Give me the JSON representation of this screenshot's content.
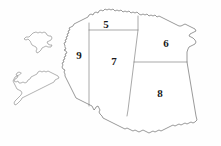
{
  "map": {
    "title": "Numbered region outline map",
    "background_color": "#fefefe",
    "outline_color": "#6f6f6f",
    "island_outline_color": "#8a8a8a",
    "label_color": "#1a1a1a",
    "regions": [
      {
        "id": "region-5",
        "label": "5",
        "label_x": 106,
        "label_y": 24,
        "position": "north-central"
      },
      {
        "id": "region-6",
        "label": "6",
        "label_x": 166,
        "label_y": 43,
        "position": "north-east"
      },
      {
        "id": "region-7",
        "label": "7",
        "label_x": 114,
        "label_y": 61,
        "position": "central"
      },
      {
        "id": "region-8",
        "label": "8",
        "label_x": 160,
        "label_y": 93,
        "position": "south-east"
      },
      {
        "id": "region-9",
        "label": "9",
        "label_x": 79,
        "label_y": 55,
        "position": "west"
      }
    ],
    "islands": [
      {
        "id": "island-north",
        "label": "",
        "position": "north-west"
      },
      {
        "id": "island-south",
        "label": "",
        "position": "south-west"
      }
    ]
  }
}
